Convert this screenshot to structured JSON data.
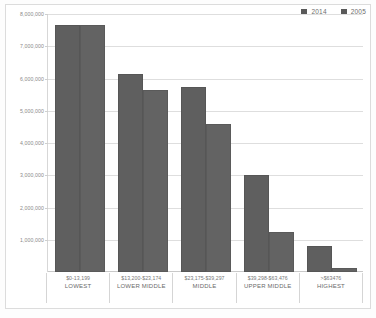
{
  "chart_data": {
    "type": "bar",
    "title": "",
    "xlabel": "",
    "ylabel": "",
    "ylim": [
      0,
      8000000
    ],
    "grid": true,
    "legend_position": "top-right",
    "categories": [
      "$0-13,199",
      "$13,200-$23,174",
      "$23,175-$39,297",
      "$39,298-$63,476",
      ">$63476"
    ],
    "category_names": [
      "LOWEST",
      "LOWER MIDDLE",
      "MIDDLE",
      "UPPER MIDDLE",
      "HIGHEST"
    ],
    "ytick_labels": [
      "8,000,000",
      "7,000,000",
      "6,000,000",
      "5,000,000",
      "4,000,000",
      "3,000,000",
      "2,000,000",
      "1,000,000"
    ],
    "ytick_values": [
      8000000,
      7000000,
      6000000,
      5000000,
      4000000,
      3000000,
      2000000,
      1000000
    ],
    "series": [
      {
        "name": "2014",
        "color": "#5f5f5f",
        "values": [
          7650000,
          6150000,
          5750000,
          3000000,
          800000
        ]
      },
      {
        "name": "2005",
        "color": "#636363",
        "values": [
          7650000,
          5650000,
          4600000,
          1250000,
          120000
        ]
      }
    ]
  },
  "legend": {
    "entries": [
      {
        "label": "2014",
        "color": "#5f5f5f"
      },
      {
        "label": "2005",
        "color": "#636363"
      }
    ]
  }
}
